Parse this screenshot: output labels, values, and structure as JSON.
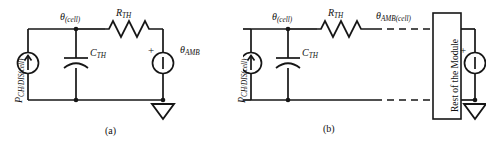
{
  "figure": {
    "background_color": "#ffffff",
    "line_color": "#161616"
  },
  "panels": [
    {
      "id": "a",
      "caption": "(a)",
      "labels": {
        "power_source": "P",
        "power_source_sub": "CH/DIS(cell)",
        "node_theta_cell": "θ",
        "node_theta_cell_sub": "(cell)",
        "resistor": "R",
        "resistor_sub": "TH",
        "capacitor": "C",
        "capacitor_sub": "TH",
        "ambient_source": "θ",
        "ambient_source_sub": "AMB",
        "polarity_plus": "+"
      },
      "components": [
        "current-source-power",
        "capacitor-cth",
        "resistor-rth",
        "voltage-source-theta-amb",
        "ground"
      ]
    },
    {
      "id": "b",
      "caption": "(b)",
      "labels": {
        "power_source": "P",
        "power_source_sub": "CH/DIS(cell)",
        "node_theta_cell": "θ",
        "node_theta_cell_sub": "(cell)",
        "resistor": "R",
        "resistor_sub": "TH",
        "capacitor": "C",
        "capacitor_sub": "TH",
        "node_theta_amb_cell": "θ",
        "node_theta_amb_cell_sub": "AMB(cell)",
        "module_box": "Rest of the Module",
        "ambient_source": "θ",
        "ambient_source_sub": "AMB",
        "polarity_plus": "+"
      },
      "components": [
        "current-source-power",
        "capacitor-cth",
        "resistor-rth",
        "dashed-connection-top",
        "dashed-connection-bottom",
        "module-box",
        "voltage-source-theta-amb",
        "ground"
      ]
    }
  ]
}
